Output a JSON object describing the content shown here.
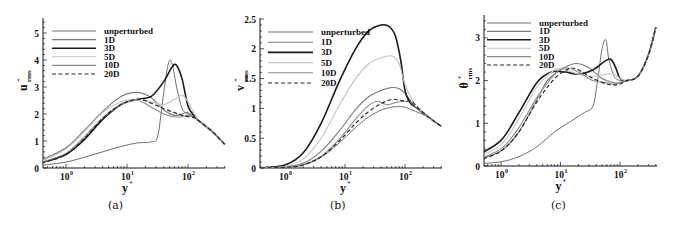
{
  "figure": {
    "captions": [
      "(a)",
      "(b)",
      "(c)"
    ]
  },
  "chart_data": [
    {
      "type": "line",
      "panel": "(a)",
      "xlabel": "y+",
      "ylabel": "u+rms",
      "xscale": "log",
      "xlim": [
        0.4,
        400
      ],
      "ylim": [
        0,
        5.5
      ],
      "xticks": [
        "10^0",
        "10^1",
        "10^2"
      ],
      "yticks": [
        0,
        1,
        2,
        3,
        4,
        5
      ],
      "legend": [
        "unperturbed",
        "1D",
        "3D",
        "5D",
        "10D",
        "20D"
      ],
      "legend_position": "upper left",
      "grid": false,
      "series": [
        {
          "name": "unperturbed",
          "x": [
            0.4,
            1,
            2,
            4,
            8,
            15,
            25,
            32,
            40,
            48,
            55,
            65,
            80,
            100,
            150,
            250,
            400
          ],
          "y": [
            0.1,
            0.22,
            0.4,
            0.6,
            0.8,
            0.93,
            0.97,
            1.2,
            2.8,
            3.9,
            3.85,
            3.0,
            2.2,
            2.0,
            1.75,
            1.35,
            0.88
          ]
        },
        {
          "name": "1D",
          "x": [
            0.4,
            1,
            2,
            4,
            8,
            15,
            25,
            40,
            60,
            80,
            100,
            150,
            250,
            400
          ],
          "y": [
            0.3,
            0.75,
            1.4,
            2.1,
            2.65,
            2.8,
            2.6,
            2.15,
            1.95,
            2.0,
            2.05,
            1.75,
            1.35,
            0.88
          ]
        },
        {
          "name": "3D",
          "x": [
            0.4,
            1,
            2,
            4,
            8,
            15,
            25,
            40,
            55,
            65,
            80,
            100,
            130,
            180,
            250,
            400
          ],
          "y": [
            0.2,
            0.5,
            1.05,
            1.8,
            2.35,
            2.55,
            2.65,
            3.2,
            3.75,
            3.8,
            3.3,
            2.3,
            1.9,
            1.6,
            1.35,
            0.88
          ]
        },
        {
          "name": "5D",
          "x": [
            0.4,
            1,
            2,
            4,
            8,
            15,
            25,
            40,
            60,
            80,
            100,
            150,
            250,
            400
          ],
          "y": [
            0.25,
            0.7,
            1.35,
            2.05,
            2.45,
            2.55,
            2.45,
            2.35,
            2.55,
            2.7,
            2.45,
            1.75,
            1.35,
            0.88
          ]
        },
        {
          "name": "10D",
          "x": [
            0.4,
            1,
            2,
            4,
            8,
            15,
            25,
            40,
            60,
            80,
            100,
            130,
            150,
            250,
            400
          ],
          "y": [
            0.2,
            0.55,
            1.15,
            1.85,
            2.35,
            2.5,
            2.25,
            2.0,
            1.9,
            1.9,
            1.95,
            1.85,
            1.75,
            1.35,
            0.88
          ]
        },
        {
          "name": "20D",
          "x": [
            0.4,
            1,
            2,
            4,
            8,
            15,
            25,
            40,
            60,
            80,
            100,
            130,
            150,
            250,
            400
          ],
          "y": [
            0.18,
            0.5,
            1.1,
            1.85,
            2.35,
            2.55,
            2.4,
            2.2,
            2.05,
            1.95,
            1.9,
            1.85,
            1.75,
            1.35,
            0.88
          ]
        }
      ]
    },
    {
      "type": "line",
      "panel": "(b)",
      "xlabel": "y+",
      "ylabel": "v+rms",
      "xscale": "log",
      "xlim": [
        0.4,
        400
      ],
      "ylim": [
        0,
        2.5
      ],
      "xticks": [
        "10^0",
        "10^1",
        "10^2"
      ],
      "yticks": [
        0,
        0.5,
        1,
        1.5,
        2,
        2.5
      ],
      "legend": [
        "unperturbed",
        "1D",
        "3D",
        "5D",
        "10D",
        "20D"
      ],
      "legend_position": "upper left",
      "grid": false,
      "series": [
        {
          "name": "unperturbed",
          "x": [
            0.4,
            1,
            2,
            4,
            8,
            15,
            25,
            40,
            60,
            80,
            100,
            150,
            250,
            400
          ],
          "y": [
            0.0,
            0.01,
            0.05,
            0.18,
            0.42,
            0.68,
            0.86,
            0.97,
            1.02,
            1.03,
            1.02,
            0.95,
            0.85,
            0.7
          ]
        },
        {
          "name": "1D",
          "x": [
            0.4,
            1,
            2,
            4,
            8,
            15,
            25,
            40,
            60,
            80,
            100,
            150,
            250,
            400
          ],
          "y": [
            0.0,
            0.02,
            0.08,
            0.28,
            0.62,
            0.98,
            1.2,
            1.3,
            1.35,
            1.33,
            1.25,
            1.02,
            0.85,
            0.7
          ]
        },
        {
          "name": "3D",
          "x": [
            0.4,
            1,
            2,
            4,
            8,
            15,
            25,
            40,
            55,
            70,
            85,
            100,
            120,
            150,
            250,
            400
          ],
          "y": [
            0.0,
            0.05,
            0.25,
            0.75,
            1.45,
            2.0,
            2.3,
            2.4,
            2.37,
            2.2,
            1.8,
            1.3,
            1.1,
            1.02,
            0.85,
            0.7
          ]
        },
        {
          "name": "5D",
          "x": [
            0.4,
            1,
            2,
            4,
            8,
            15,
            25,
            40,
            60,
            80,
            100,
            150,
            250,
            400
          ],
          "y": [
            0.0,
            0.03,
            0.15,
            0.5,
            1.05,
            1.5,
            1.75,
            1.85,
            1.88,
            1.75,
            1.4,
            1.05,
            0.85,
            0.7
          ]
        },
        {
          "name": "10D",
          "x": [
            0.4,
            1,
            2,
            4,
            8,
            15,
            25,
            35,
            50,
            70,
            100,
            130,
            150,
            250,
            400
          ],
          "y": [
            0.0,
            0.01,
            0.06,
            0.2,
            0.48,
            0.82,
            1.05,
            1.12,
            1.06,
            1.1,
            1.12,
            1.1,
            1.02,
            0.85,
            0.7
          ]
        },
        {
          "name": "20D",
          "x": [
            0.4,
            1,
            2,
            4,
            8,
            15,
            25,
            40,
            60,
            80,
            100,
            130,
            150,
            250,
            400
          ],
          "y": [
            0.0,
            0.01,
            0.05,
            0.19,
            0.45,
            0.75,
            0.95,
            1.08,
            1.15,
            1.14,
            1.12,
            1.12,
            1.05,
            0.85,
            0.7
          ]
        }
      ]
    },
    {
      "type": "line",
      "panel": "(c)",
      "xlabel": "y+",
      "ylabel": "θ+rms",
      "xscale": "log",
      "xlim": [
        0.4,
        400
      ],
      "ylim": [
        0,
        3.5
      ],
      "xticks": [
        "10^0",
        "10^1",
        "10^2"
      ],
      "yticks": [
        0,
        1,
        2,
        3
      ],
      "legend": [
        "unperturbed",
        "1D",
        "3D",
        "5D",
        "10D",
        "20D"
      ],
      "legend_position": "upper left",
      "grid": false,
      "series": [
        {
          "name": "unperturbed",
          "x": [
            0.4,
            1,
            2,
            4,
            8,
            15,
            25,
            35,
            42,
            50,
            58,
            65,
            80,
            100,
            130,
            200,
            300,
            400
          ],
          "y": [
            0.05,
            0.1,
            0.22,
            0.45,
            0.8,
            1.05,
            1.25,
            1.4,
            2.0,
            2.75,
            2.95,
            2.5,
            2.1,
            2.0,
            2.0,
            2.1,
            2.6,
            3.25
          ]
        },
        {
          "name": "1D",
          "x": [
            0.4,
            1,
            2,
            4,
            6,
            10,
            18,
            30,
            50,
            80,
            100,
            130,
            200,
            300,
            400
          ],
          "y": [
            0.15,
            0.35,
            0.8,
            1.55,
            2.0,
            2.25,
            2.4,
            2.3,
            2.05,
            1.95,
            1.95,
            2.0,
            2.1,
            2.6,
            3.25
          ]
        },
        {
          "name": "3D",
          "x": [
            0.4,
            1,
            2,
            4,
            7,
            12,
            20,
            35,
            55,
            70,
            85,
            100,
            130,
            200,
            300,
            400
          ],
          "y": [
            0.25,
            0.6,
            1.25,
            1.95,
            2.2,
            2.2,
            2.15,
            2.25,
            2.45,
            2.5,
            2.3,
            2.05,
            2.0,
            2.1,
            2.6,
            3.25
          ]
        },
        {
          "name": "5D",
          "x": [
            0.4,
            1,
            2,
            4,
            8,
            12,
            20,
            35,
            60,
            80,
            100,
            130,
            200,
            300,
            400
          ],
          "y": [
            0.2,
            0.5,
            1.1,
            1.85,
            2.25,
            2.25,
            2.15,
            2.1,
            2.15,
            2.15,
            2.05,
            2.0,
            2.1,
            2.6,
            3.25
          ]
        },
        {
          "name": "10D",
          "x": [
            0.4,
            1,
            2,
            4,
            8,
            12,
            20,
            35,
            60,
            80,
            100,
            130,
            200,
            300,
            400
          ],
          "y": [
            0.15,
            0.4,
            0.9,
            1.6,
            2.15,
            2.3,
            2.2,
            2.0,
            1.95,
            1.92,
            1.95,
            2.0,
            2.1,
            2.6,
            3.25
          ]
        },
        {
          "name": "20D",
          "x": [
            0.4,
            1,
            2,
            4,
            8,
            14,
            20,
            35,
            60,
            80,
            100,
            130,
            200,
            300,
            400
          ],
          "y": [
            0.12,
            0.35,
            0.8,
            1.5,
            2.05,
            2.28,
            2.25,
            2.05,
            1.92,
            1.9,
            1.92,
            2.0,
            2.1,
            2.6,
            3.25
          ]
        }
      ]
    }
  ],
  "styles": {
    "unperturbed": {
      "color": "#6f6f6f",
      "width": 1.0,
      "dash": ""
    },
    "1D": {
      "color": "#7a7a7a",
      "width": 1.1,
      "dash": ""
    },
    "3D": {
      "color": "#1a1a1a",
      "width": 1.6,
      "dash": ""
    },
    "5D": {
      "color": "#c4c4c4",
      "width": 1.1,
      "dash": ""
    },
    "10D": {
      "color": "#8c8c8c",
      "width": 1.1,
      "dash": ""
    },
    "20D": {
      "color": "#2a2a2a",
      "width": 1.2,
      "dash": "4,2.5"
    }
  }
}
